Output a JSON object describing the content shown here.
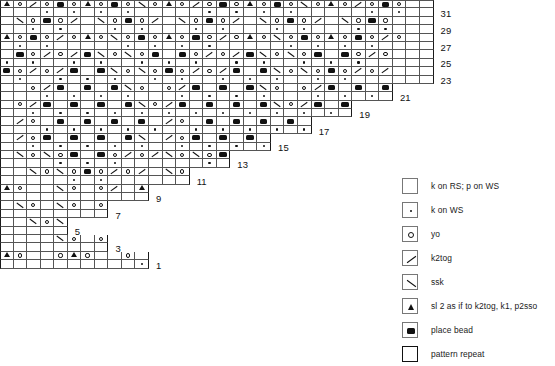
{
  "chart_data": {
    "type": "table",
    "columns": 32,
    "rows": 32,
    "row_numbers_visible": [
      1,
      3,
      5,
      7,
      9,
      11,
      13,
      15,
      17,
      19,
      21,
      23,
      25,
      27,
      29,
      31
    ],
    "symbol_key": {
      "blank": "k on RS; p on WS",
      "dot": "k on WS",
      "yo": "yo",
      "k2tog": "k2tog",
      "ssk": "ssk",
      "cdd": "sl 2 as if to k2tog, k1, p2sso",
      "bead": "place bead"
    },
    "grid": [
      "A.O./.O.B.O.A.O.B.O.\\.O.A.O./.O.B.O.A.O.B.O.\\.O.A.O./.O.B.O",
      "..\\.O.B.O./...\\.O.B.O./...\\.O.B.O./...\\.O.B.O./...\\.O.B.O",
      "A.O.B.O./.O.A.O.\\.O.B.O.A.O.B.O./.O.A.O.\\.O.B.O.A.O.B.O./.O",
      "..B.O./.O./.B.\\.O.\\.O.B...B.O./.O./.B.\\.O.\\.O.B...B.O./.O.",
      "B.O./.O./.B...B.\\.O.\\.O.B.O./.O./.B...B.\\.O.\\.O.B.O./.O./.",
      "....O./.B...B...B.\\.O...O./.B...B...B.\\.O...O./.B...B...B.\\",
      "..O./.B...B...B...B.\\.O./.B...B...B...B.\\.O./.B...B...B...B",
      "../.O...B...B...B...B.../.O...B...B...B...B.../.O...B...B...",
      "../.O.B...B...B...B.\\.../.O.B...B...B...B.\\.../.O.B...B...B",
      "..\\.O.\\.O.B...B.O./.O./.\\.O.\\.O.B...B.O./.O./.\\.O.\\.O.B...",
      "....\\.O.\\.O.B.O./.O./...\\.O.\\.O.B.O./.O./...\\.O.\\.O.B.O./.",
      "A.O.....\\.O...O./...A.O.....\\.O...O./...A.O.....\\.O...O./..",
      "..\\.O...\\.O...O./.O./...\\.O...\\.O...O./.O./...\\.O...\\.O...",
      "....\\.O.\\.O...O./.O./.....\\.O.\\.O...O./.O./.....\\.O.\\.O...",
      "........\\.O...O./.........\\.O...O./.........\\.O...O./......",
      "A.O.....O.A.O.....O...B.O...A.O.....O.A.O.....O...B.O...A.O."
    ],
    "stair_rows_visible_columns": [
      32,
      32,
      32,
      32,
      32,
      32,
      32,
      32,
      32,
      32,
      32,
      31,
      28,
      25,
      22,
      19,
      16,
      13,
      10,
      7,
      32,
      32
    ]
  },
  "chart": {
    "row_labels": [
      "1",
      "3",
      "5",
      "7",
      "9",
      "11",
      "13",
      "15",
      "17",
      "19",
      "21",
      "23",
      "25",
      "27",
      "29",
      "31"
    ]
  },
  "legend": {
    "items": [
      {
        "symbol": "blank-square-icon",
        "label": "k on RS; p on WS"
      },
      {
        "symbol": "purl-dot-icon",
        "label": "k on WS"
      },
      {
        "symbol": "yarn-over-icon",
        "label": "yo"
      },
      {
        "symbol": "k2tog-icon",
        "label": "k2tog"
      },
      {
        "symbol": "ssk-icon",
        "label": "ssk"
      },
      {
        "symbol": "cdd-icon",
        "label": "sl 2 as if to k2tog, k1, p2sso"
      },
      {
        "symbol": "place-bead-icon",
        "label": "place bead"
      },
      {
        "symbol": "pattern-repeat-icon",
        "label": "pattern repeat"
      }
    ]
  },
  "colors": {
    "ink": "#1a1a1a",
    "grid": "#555555",
    "background": "#ffffff"
  }
}
